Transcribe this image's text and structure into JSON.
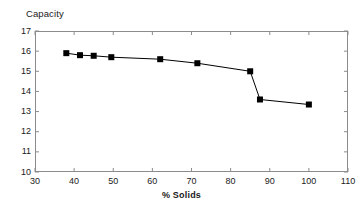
{
  "chart_data": {
    "type": "line",
    "title": "Capacity",
    "subtitle": "",
    "xlabel": "% Solids",
    "ylabel": "Capacity",
    "xlim": [
      30,
      110
    ],
    "ylim": [
      10,
      17
    ],
    "xticks": [
      30,
      40,
      50,
      60,
      70,
      80,
      90,
      100,
      110
    ],
    "yticks": [
      10,
      11,
      12,
      13,
      14,
      15,
      16,
      17
    ],
    "grid": false,
    "legend": false,
    "legend_position": "none",
    "marker": "filled-square",
    "line_color": "#000000",
    "marker_color": "#000000",
    "frame_color": "#8c8c8c",
    "background": "#ffffff",
    "x": [
      38,
      41.5,
      45,
      49.5,
      62,
      71.5,
      85,
      87.5,
      100
    ],
    "y": [
      15.9,
      15.8,
      15.77,
      15.7,
      15.6,
      15.4,
      15.0,
      13.6,
      13.35
    ],
    "series": [
      {
        "name": "Capacity",
        "points": [
          {
            "x": 38,
            "y": 15.9
          },
          {
            "x": 41.5,
            "y": 15.8
          },
          {
            "x": 45,
            "y": 15.77
          },
          {
            "x": 49.5,
            "y": 15.7
          },
          {
            "x": 62,
            "y": 15.6
          },
          {
            "x": 71.5,
            "y": 15.4
          },
          {
            "x": 85,
            "y": 15.0
          },
          {
            "x": 87.5,
            "y": 13.6
          },
          {
            "x": 100,
            "y": 13.35
          }
        ]
      }
    ]
  },
  "axes": {
    "ytick_labels": [
      "17",
      "16",
      "15",
      "14",
      "13",
      "12",
      "11",
      "10"
    ],
    "xtick_labels": [
      "30",
      "40",
      "50",
      "60",
      "70",
      "80",
      "90",
      "100",
      "110"
    ]
  },
  "labels": {
    "title": "Capacity",
    "xaxis_title": "% Solids"
  }
}
